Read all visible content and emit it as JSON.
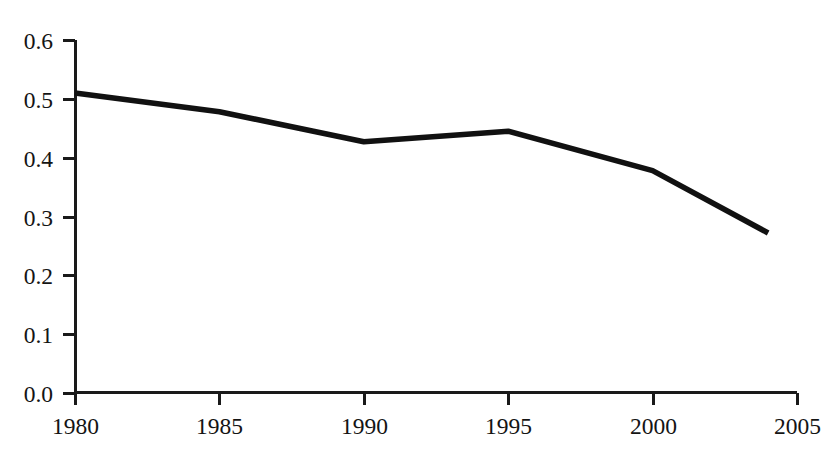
{
  "chart_data": {
    "type": "line",
    "title": "",
    "subtitle": "",
    "xlabel": "",
    "ylabel": "",
    "x": [
      1980,
      1985,
      1990,
      1995,
      2000,
      2004
    ],
    "values": [
      0.51,
      0.478,
      0.427,
      0.445,
      0.378,
      0.272
    ],
    "series": [
      {
        "name": "",
        "x": [
          1980,
          1985,
          1990,
          1995,
          2000,
          2004
        ],
        "values": [
          0.51,
          0.478,
          0.427,
          0.445,
          0.378,
          0.272
        ],
        "color": "#111111"
      }
    ],
    "xlim": [
      1980,
      2005
    ],
    "ylim": [
      0.0,
      0.6
    ],
    "xticks": [
      1980,
      1985,
      1990,
      1995,
      2000,
      2005
    ],
    "yticks": [
      0.0,
      0.1,
      0.2,
      0.3,
      0.4,
      0.5,
      0.6
    ],
    "xtick_labels": [
      "1980",
      "1985",
      "1990",
      "1995",
      "2000",
      "2005"
    ],
    "ytick_labels": [
      "0.0",
      "0.1",
      "0.2",
      "0.3",
      "0.4",
      "0.5",
      "0.6"
    ],
    "grid": false,
    "legend": false,
    "legend_position": "none",
    "annotations": [],
    "line_color": "#111111",
    "axis_color": "#1a1a1a",
    "background": "#ffffff"
  }
}
